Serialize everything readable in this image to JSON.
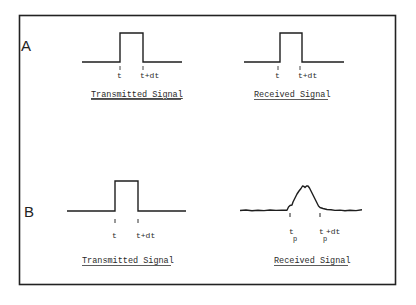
{
  "figure": {
    "border_color": "#222222",
    "line_color": "#1e1e1e",
    "panels": [
      {
        "label": "A",
        "signals": [
          {
            "caption": "Transmitted Signal",
            "tick_labels": [
              "t",
              "t+dt"
            ],
            "shape": "rectangular-pulse"
          },
          {
            "caption": "Received Signal",
            "tick_labels": [
              "t",
              "t+dt"
            ],
            "shape": "rectangular-pulse"
          }
        ]
      },
      {
        "label": "B",
        "signals": [
          {
            "caption": "Transmitted Signal",
            "tick_labels": [
              "t",
              "t+dt"
            ],
            "shape": "rectangular-pulse"
          },
          {
            "caption": "Received Signal",
            "tick_labels": [
              {
                "base": "t",
                "sub": "p",
                "suffix": ""
              },
              {
                "base": "t",
                "sub": "p",
                "suffix": "+dt"
              }
            ],
            "shape": "distorted-noisy-pulse"
          }
        ]
      }
    ]
  }
}
